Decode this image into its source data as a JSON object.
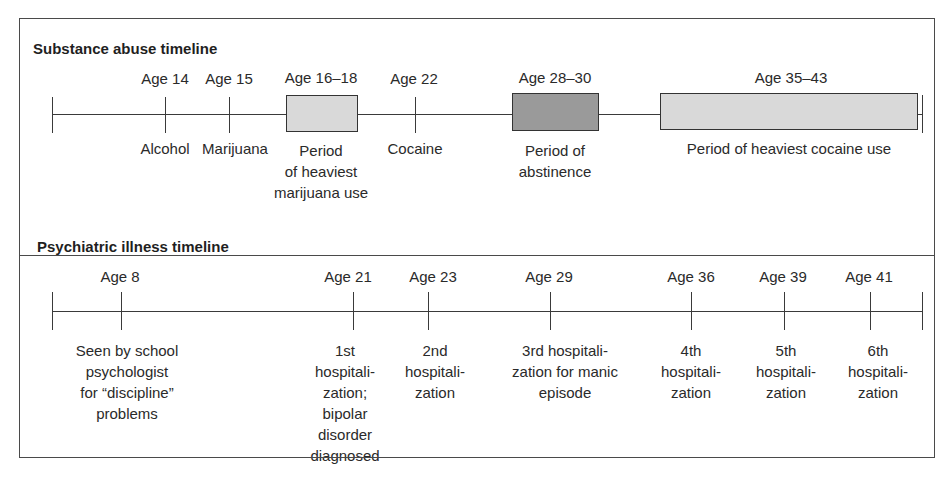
{
  "figure": {
    "frame_color": "#4a4a4a",
    "light_fill": "#d9d9d9",
    "dark_fill": "#9a9a9a"
  },
  "substance": {
    "title": "Substance abuse timeline",
    "events": [
      {
        "age": "Age 14",
        "label": "Alcohol"
      },
      {
        "age": "Age 15",
        "label": "Marijuana"
      },
      {
        "age": "Age 16–18",
        "label": "Period\nof heaviest\nmarijuana use"
      },
      {
        "age": "Age 22",
        "label": "Cocaine"
      },
      {
        "age": "Age 28–30",
        "label": "Period of\nabstinence"
      },
      {
        "age": "Age 35–43",
        "label": "Period of heaviest cocaine use"
      }
    ]
  },
  "psychiatric": {
    "title": "Psychiatric illness timeline",
    "events": [
      {
        "age": "Age 8",
        "label": "Seen by school\npsychologist\nfor “discipline”\nproblems"
      },
      {
        "age": "Age 21",
        "label": "1st\nhospitali-\nzation;\nbipolar\ndisorder\ndiagnosed"
      },
      {
        "age": "Age 23",
        "label": "2nd\nhospitali-\nzation"
      },
      {
        "age": "Age 29",
        "label": "3rd hospitali-\nzation for manic\nepisode"
      },
      {
        "age": "Age 36",
        "label": "4th\nhospitali-\nzation"
      },
      {
        "age": "Age 39",
        "label": "5th\nhospitali-\nzation"
      },
      {
        "age": "Age 41",
        "label": "6th\nhospitali-\nzation"
      }
    ]
  }
}
